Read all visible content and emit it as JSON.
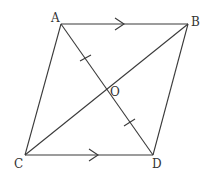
{
  "diagram": {
    "type": "parallelogram-with-diagonals",
    "stroke_color": "#3a3a3a",
    "points": {
      "A": {
        "label": "A",
        "x": 61,
        "y": 24
      },
      "B": {
        "label": "B",
        "x": 188,
        "y": 24
      },
      "C": {
        "label": "C",
        "x": 25,
        "y": 155
      },
      "D": {
        "label": "D",
        "x": 153,
        "y": 155
      },
      "O": {
        "label": "O",
        "x": 107,
        "y": 89
      }
    },
    "labels": {
      "A": "A",
      "B": "B",
      "C": "C",
      "D": "D",
      "O": "O"
    },
    "segments": [
      "AB",
      "BD",
      "DC",
      "CA",
      "AD",
      "CB"
    ],
    "parallel_marks": [
      "AB",
      "CD"
    ],
    "equal_marks": [
      "AO",
      "OD"
    ]
  }
}
